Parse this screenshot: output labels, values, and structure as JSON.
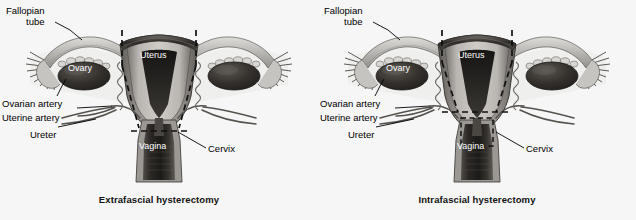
{
  "figure": {
    "background_color": "#f6f6f6",
    "panel_count": 2
  },
  "panels": [
    {
      "id": "extrafascial",
      "caption": "Extrafascial hysterectomy",
      "labels": {
        "fallopian_tube_line1": "Fallopian",
        "fallopian_tube_line2": "tube",
        "ovary": "Ovary",
        "uterus": "Uterus",
        "ovarian_artery": "Ovarian artery",
        "uterine_artery": "Uterine artery",
        "ureter": "Ureter",
        "vagina": "Vagina",
        "cervix": "Cervix"
      },
      "resection_line": {
        "style": "dashed",
        "description": "wide lateral dashed line angling outside the cervix to a broad horizontal cut at the vaginal cuff",
        "color": "#111111"
      }
    },
    {
      "id": "intrafascial",
      "caption": "Intrafascial hysterectomy",
      "labels": {
        "fallopian_tube_line1": "Fallopian",
        "fallopian_tube_line2": "tube",
        "ovary": "Ovary",
        "uterus": "Uterus",
        "ovarian_artery": "Ovarian artery",
        "uterine_artery": "Uterine artery",
        "ureter": "Ureter",
        "vagina": "Vagina",
        "cervix": "Cervix"
      },
      "resection_line": {
        "style": "dashed",
        "description": "dashed line angling inward to a horizontal cut plus an inner dashed rectangle around the cervical canal",
        "color": "#111111"
      }
    }
  ],
  "anatomy_colors": {
    "uterus_serosa": "#8f8f8f",
    "uterus_myometrium": "#b4b0ac",
    "endometrial_cavity": "#2a2724",
    "fundus_band": "#3a3734",
    "ovary": "#2e2b28",
    "tube": "#b9b7b3",
    "vessel": "#55524e",
    "vagina_canal": "#36332f",
    "outline": "#3d3a36"
  }
}
